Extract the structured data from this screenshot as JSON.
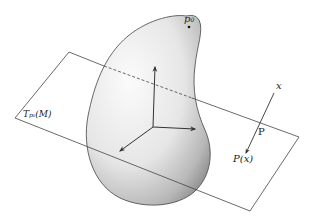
{
  "diagram": {
    "labels": {
      "point": "p",
      "point_sub": "0",
      "tangent_plane": "T",
      "tangent_plane_sub": "p₀",
      "tangent_plane_arg": "(M)",
      "x": "x",
      "P": "P",
      "Px": "P(x)"
    },
    "colors": {
      "stroke": "#333333",
      "surface_light": "#f4f4f4",
      "surface_dark": "#9a9a9a",
      "background": "#ffffff"
    }
  }
}
